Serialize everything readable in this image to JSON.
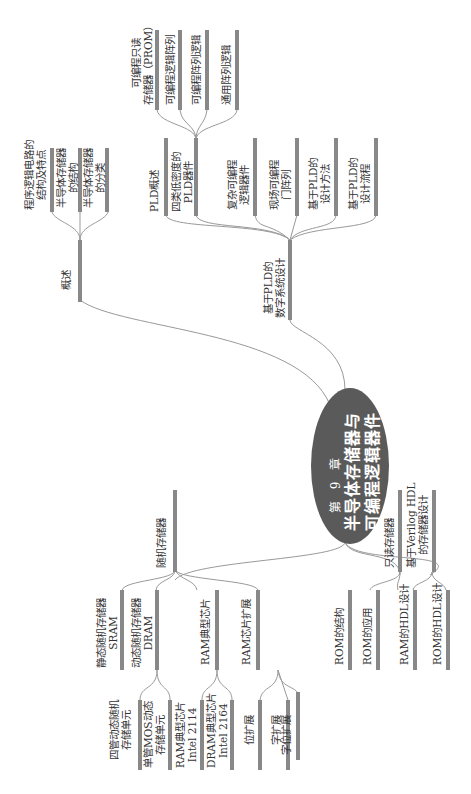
{
  "center": {
    "chapter": "第 9 章",
    "title_line1": "半导体存储器与",
    "title_line2": "可编程逻辑器件"
  },
  "branches": {
    "overview": {
      "label": "概述",
      "children": [
        {
          "label_l1": "程序逻辑电路的",
          "label_l2": "结构及特点"
        },
        {
          "label_l1": "半导体存储器",
          "label_l2": "的结构"
        },
        {
          "label_l1": "半导体存储器",
          "label_l2": "的分类"
        }
      ]
    },
    "pld": {
      "label_l1": "基于PLD的",
      "label_l2": "数字系统设计",
      "children": [
        {
          "label_l1": "PLD概述",
          "label_l2": ""
        },
        {
          "label_l1": "四类低密度的",
          "label_l2": "PLD器件",
          "children": [
            {
              "label_l1": "可编程只读",
              "label_l2": "存储器（PROM）"
            },
            {
              "label_l1": "可编程逻辑阵列",
              "label_l2": ""
            },
            {
              "label_l1": "可编程阵列逻辑",
              "label_l2": ""
            },
            {
              "label_l1": "通用阵列逻辑",
              "label_l2": ""
            }
          ]
        },
        {
          "label_l1": "复杂可编程",
          "label_l2": "逻辑器件"
        },
        {
          "label_l1": "现场可编程",
          "label_l2": "门阵列"
        },
        {
          "label_l1": "基于PLD的",
          "label_l2": "设计方法"
        },
        {
          "label_l1": "基于PLD的",
          "label_l2": "设计流程"
        }
      ]
    },
    "ram": {
      "label": "随机存储器",
      "children": [
        {
          "label_l1": "静态随机存储器",
          "label_l2": "SRAM",
          "children": [
            {
              "label_l1": "四管动态随机",
              "label_l2": "存储单元"
            }
          ]
        },
        {
          "label_l1": "动态随机存储器",
          "label_l2": "DRAM",
          "children": [
            {
              "label_l1": "单管MOS动态",
              "label_l2": "存储单元"
            }
          ]
        },
        {
          "label_l1": "RAM典型芯片",
          "label_l2": "",
          "children": [
            {
              "label_l1": "RAM典型芯片",
              "label_l2": "Intel 2114"
            },
            {
              "label_l1": "DRAM典型芯片",
              "label_l2": "Intel 2164"
            }
          ]
        },
        {
          "label_l1": "RAM芯片扩展",
          "label_l2": "",
          "children": [
            {
              "label_l1": "位扩展",
              "label_l2": ""
            },
            {
              "label_l1": "字扩展",
              "label_l2": ""
            },
            {
              "label_l1": "字位扩展",
              "label_l2": ""
            }
          ]
        }
      ]
    },
    "rom": {
      "label": "只读存储器",
      "children": [
        {
          "label_l1": "ROM的结构",
          "label_l2": ""
        },
        {
          "label_l1": "ROM的应用",
          "label_l2": ""
        }
      ]
    },
    "hdl": {
      "label_l1": "基于Verilog HDL",
      "label_l2": "的存储器设计",
      "children": [
        {
          "label_l1": "RAM的HDL设计",
          "label_l2": ""
        },
        {
          "label_l1": "ROM的HDL设计",
          "label_l2": ""
        }
      ]
    }
  },
  "colors": {
    "ellipse": "#5a5a5a",
    "bar": "#888888",
    "line": "#999999",
    "text": "#333333"
  }
}
